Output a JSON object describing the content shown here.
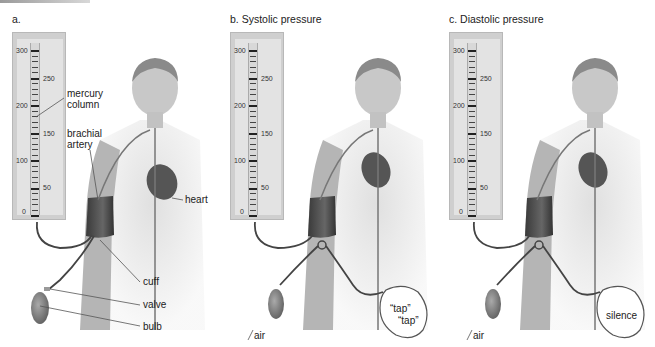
{
  "figure": {
    "panels": [
      {
        "id": "a",
        "title": "a.",
        "gauge_scale": {
          "min": 0,
          "max": 300,
          "left_labels": [
            "300",
            "200",
            "100",
            "0"
          ],
          "right_labels": [
            "250",
            "150",
            "50"
          ]
        },
        "labels": {
          "mercury_column": [
            "mercury",
            "column"
          ],
          "brachial_artery": [
            "brachial",
            "artery"
          ],
          "heart": "heart",
          "cuff": "cuff",
          "valve": "valve",
          "bulb": "bulb"
        }
      },
      {
        "id": "b",
        "title": "b. Systolic pressure",
        "gauge_scale": {
          "min": 0,
          "max": 300,
          "left_labels": [
            "300",
            "200",
            "100",
            "0"
          ],
          "right_labels": [
            "250",
            "150",
            "50"
          ]
        },
        "labels": {
          "air": "air",
          "sound_1": "“tap”",
          "sound_2": "“tap”"
        }
      },
      {
        "id": "c",
        "title": "c. Diastolic pressure",
        "gauge_scale": {
          "min": 0,
          "max": 300,
          "left_labels": [
            "300",
            "200",
            "100",
            "0"
          ],
          "right_labels": [
            "250",
            "150",
            "50"
          ]
        },
        "labels": {
          "air": "air",
          "sound": "silence"
        }
      }
    ],
    "colors": {
      "skin": "#c9c9c9",
      "cuff": "#4a4a4a",
      "gauge": "#cfcfcf",
      "line": "#555555"
    }
  }
}
